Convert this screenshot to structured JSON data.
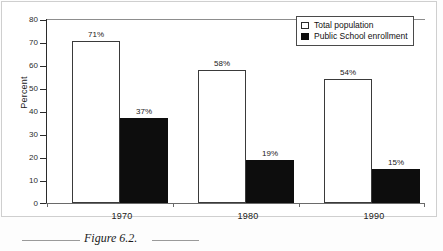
{
  "figure": {
    "caption": "Figure 6.2.",
    "rule_left": "",
    "rule_right": ""
  },
  "chart_data": {
    "type": "bar",
    "title": "",
    "subtitle": "",
    "xlabel": "",
    "ylabel": "Percent",
    "categories": [
      "1970",
      "1980",
      "1990"
    ],
    "series": [
      {
        "name": "Total population",
        "values": [
          71,
          58,
          54
        ],
        "labels": [
          "71%",
          "58%",
          "54%"
        ],
        "color": "#ffffff",
        "edge_color": "#3a3a3a",
        "swatch": "hollow"
      },
      {
        "name": "Public School enrollment",
        "values": [
          37,
          19,
          15
        ],
        "labels": [
          "37%",
          "19%",
          "15%"
        ],
        "color": "#0d0d0d",
        "edge_color": "#0d0d0d",
        "swatch": "filled"
      }
    ],
    "ylim": [
      0,
      80
    ],
    "yticks": [
      0,
      10,
      20,
      30,
      40,
      50,
      60,
      70,
      80
    ],
    "ytick_labels": [
      "0",
      "10",
      "20",
      "30",
      "40",
      "50",
      "60",
      "70",
      "80"
    ],
    "grid": false,
    "legend_position": "top-right",
    "legend_entries": [
      "Total population",
      "Public School enrollment"
    ],
    "value_labels_shown": true,
    "bar_grouping": "adjacent"
  }
}
